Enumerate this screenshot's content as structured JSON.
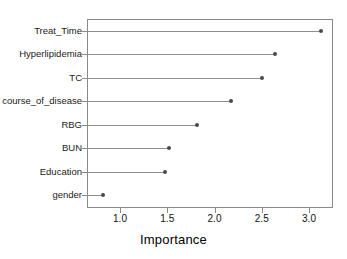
{
  "chart_data": {
    "type": "scatter",
    "plot_style": "lollipop-dotchart",
    "title": "",
    "subtitle": "",
    "xlabel": "Importance",
    "ylabel": "",
    "categories": [
      "Treat_Time",
      "Hyperlipidemia",
      "TC",
      "course_of_disease",
      "RBG",
      "BUN",
      "Education",
      "gender"
    ],
    "values": [
      3.13,
      2.64,
      2.5,
      2.17,
      1.81,
      1.52,
      1.48,
      0.82
    ],
    "xlim": [
      0.69,
      3.25
    ],
    "xticks": [
      1.0,
      1.5,
      2.0,
      2.5,
      3.0
    ],
    "xtick_labels": [
      "1.0",
      "1.5",
      "2.0",
      "2.5",
      "3.0"
    ],
    "grid": false,
    "legend": null,
    "legend_position": "none",
    "annotations": [],
    "colors": {
      "dot": "#4a4a4a",
      "stem": "#8f8f8f",
      "frame": "#8a8a8a",
      "text": "#111111",
      "background": "#ffffff"
    }
  }
}
